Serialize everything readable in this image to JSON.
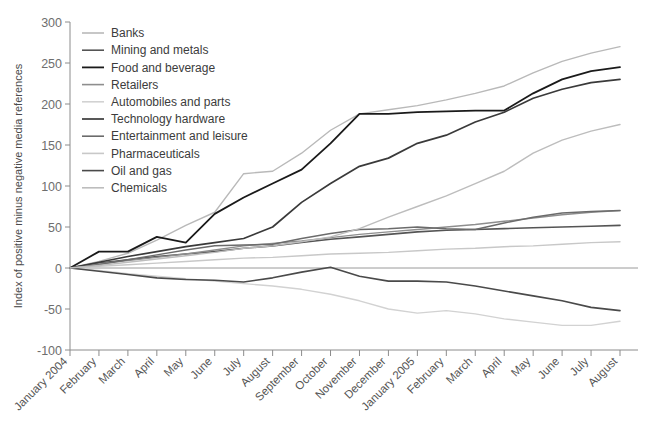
{
  "chart_data": {
    "type": "line",
    "title": "",
    "xlabel": "",
    "ylabel": "Index of positive minus negative media references",
    "ylim": [
      -100,
      300
    ],
    "yticks": [
      -100,
      -50,
      0,
      50,
      100,
      150,
      200,
      250,
      300
    ],
    "grid": false,
    "legend_position": "top-left",
    "zero_reference_line": true,
    "categories": [
      "January 2004",
      "February",
      "March",
      "April",
      "May",
      "June",
      "July",
      "August",
      "September",
      "October",
      "November",
      "December",
      "January 2005",
      "February",
      "March",
      "April",
      "May",
      "June",
      "July",
      "August"
    ],
    "series": [
      {
        "name": "Banks",
        "color": "#b9b9b9",
        "width": 1.4,
        "values": [
          0,
          8,
          18,
          34,
          52,
          68,
          115,
          118,
          140,
          168,
          188,
          193,
          198,
          205,
          213,
          222,
          238,
          252,
          262,
          270
        ]
      },
      {
        "name": "Mining and metals",
        "color": "#555555",
        "width": 1.6,
        "values": [
          0,
          6,
          10,
          14,
          17,
          20,
          24,
          27,
          31,
          35,
          38,
          41,
          44,
          46,
          47,
          48,
          49,
          50,
          51,
          52
        ]
      },
      {
        "name": "Food and beverage",
        "color": "#1a1a1a",
        "width": 1.8,
        "values": [
          0,
          20,
          20,
          38,
          31,
          66,
          86,
          103,
          120,
          152,
          188,
          188,
          190,
          191,
          192,
          192,
          213,
          230,
          240,
          245
        ]
      },
      {
        "name": "Retailers",
        "color": "#8e8e8e",
        "width": 1.4,
        "values": [
          0,
          5,
          9,
          13,
          17,
          22,
          27,
          30,
          33,
          37,
          41,
          44,
          47,
          50,
          53,
          57,
          61,
          65,
          68,
          70
        ]
      },
      {
        "name": "Automobiles and parts",
        "color": "#d2d2d2",
        "width": 1.4,
        "values": [
          0,
          -3,
          -7,
          -10,
          -13,
          -16,
          -19,
          -22,
          -26,
          -32,
          -40,
          -50,
          -55,
          -52,
          -56,
          -62,
          -66,
          -70,
          -70,
          -65
        ]
      },
      {
        "name": "Technology hardware",
        "color": "#3a3a3a",
        "width": 1.7,
        "values": [
          0,
          7,
          14,
          20,
          26,
          31,
          36,
          50,
          80,
          103,
          124,
          134,
          152,
          162,
          178,
          190,
          207,
          218,
          226,
          230
        ]
      },
      {
        "name": "Entertainment and leisure",
        "color": "#6b6b6b",
        "width": 1.5,
        "values": [
          0,
          4,
          10,
          16,
          22,
          27,
          28,
          29,
          36,
          42,
          47,
          48,
          50,
          48,
          47,
          55,
          62,
          67,
          69,
          70
        ]
      },
      {
        "name": "Pharmaceuticals",
        "color": "#c8c8c8",
        "width": 1.4,
        "values": [
          0,
          2,
          4,
          6,
          8,
          10,
          12,
          13,
          15,
          17,
          18,
          19,
          21,
          23,
          24,
          26,
          27,
          29,
          31,
          32
        ]
      },
      {
        "name": "Oil and gas",
        "color": "#4a4a4a",
        "width": 1.6,
        "values": [
          0,
          -4,
          -8,
          -12,
          -14,
          -15,
          -17,
          -12,
          -5,
          1,
          -10,
          -16,
          -16,
          -17,
          -22,
          -28,
          -34,
          -40,
          -48,
          -52
        ]
      },
      {
        "name": "Chemicals",
        "color": "#bdbdbd",
        "width": 1.4,
        "values": [
          0,
          3,
          7,
          11,
          15,
          19,
          24,
          27,
          32,
          38,
          48,
          62,
          75,
          88,
          103,
          118,
          140,
          156,
          167,
          175
        ]
      }
    ]
  }
}
